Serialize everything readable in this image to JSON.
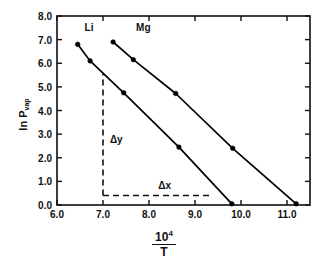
{
  "chart_data": {
    "type": "line",
    "title": "",
    "xlabel": "10^4 / T",
    "xlabel_numerator": "10",
    "xlabel_numerator_exp": "4",
    "xlabel_denominator": "T",
    "ylabel": "ln P",
    "ylabel_sub": "vap",
    "xlim": [
      6.0,
      11.5
    ],
    "ylim": [
      0.0,
      8.0
    ],
    "xticks": [
      6.0,
      7.0,
      8.0,
      9.0,
      10.0,
      11.0
    ],
    "yticks": [
      0.0,
      1.0,
      2.0,
      3.0,
      4.0,
      5.0,
      6.0,
      7.0,
      8.0
    ],
    "xtick_labels": [
      "6.0",
      "7.0",
      "8.0",
      "9.0",
      "10.0",
      "11.0"
    ],
    "ytick_labels": [
      "0.0",
      "1.0",
      "2.0",
      "3.0",
      "4.0",
      "5.0",
      "6.0",
      "7.0",
      "8.0"
    ],
    "grid": false,
    "legend": "inline-labels",
    "frame": "box",
    "tick_direction": "in",
    "series": [
      {
        "name": "Li",
        "label": "Li",
        "label_x": 6.6,
        "label_y": 7.45,
        "color": "#000000",
        "marker": "filled-circle",
        "points": [
          {
            "x": 6.45,
            "y": 6.8
          },
          {
            "x": 6.72,
            "y": 6.1
          },
          {
            "x": 7.45,
            "y": 4.75
          },
          {
            "x": 8.65,
            "y": 2.45
          },
          {
            "x": 9.8,
            "y": 0.05
          }
        ]
      },
      {
        "name": "Mg",
        "label": "Mg",
        "label_x": 7.72,
        "label_y": 7.45,
        "color": "#000000",
        "marker": "filled-circle",
        "points": [
          {
            "x": 7.22,
            "y": 6.9
          },
          {
            "x": 7.66,
            "y": 6.15
          },
          {
            "x": 8.58,
            "y": 4.72
          },
          {
            "x": 9.82,
            "y": 2.4
          },
          {
            "x": 11.2,
            "y": 0.05
          }
        ]
      }
    ],
    "annotations": [
      {
        "name": "delta-y",
        "label": "Δy",
        "style": "dashed",
        "orientation": "vertical",
        "x": 7.0,
        "y_start": 0.4,
        "y_end": 5.55,
        "label_x": 7.15,
        "label_y": 2.7
      },
      {
        "name": "delta-x",
        "label": "Δx",
        "style": "dashed",
        "orientation": "horizontal",
        "y": 0.4,
        "x_start": 7.0,
        "x_end": 9.35,
        "label_x": 8.2,
        "label_y": 0.78
      }
    ]
  }
}
